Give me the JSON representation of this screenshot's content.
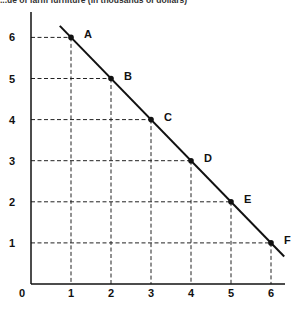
{
  "chart_data": {
    "type": "line",
    "title": "...ue of farm furniture (in thousands of dollars)",
    "xlabel": "",
    "ylabel": "",
    "xlim": [
      0,
      6
    ],
    "ylim": [
      0,
      6
    ],
    "x_ticks": [
      "0",
      "1",
      "2",
      "3",
      "4",
      "5",
      "6"
    ],
    "y_ticks": [
      "1",
      "2",
      "3",
      "4",
      "5",
      "6"
    ],
    "grid": "dashed guide lines from each point to both axes",
    "series": [
      {
        "name": "Line",
        "points": [
          {
            "label": "A",
            "x": 1,
            "y": 6
          },
          {
            "label": "B",
            "x": 2,
            "y": 5
          },
          {
            "label": "C",
            "x": 3,
            "y": 4
          },
          {
            "label": "D",
            "x": 4,
            "y": 3
          },
          {
            "label": "E",
            "x": 5,
            "y": 2
          },
          {
            "label": "F",
            "x": 6,
            "y": 1
          }
        ]
      }
    ],
    "line_color": "#111111"
  },
  "labels": {
    "origin": "0"
  }
}
